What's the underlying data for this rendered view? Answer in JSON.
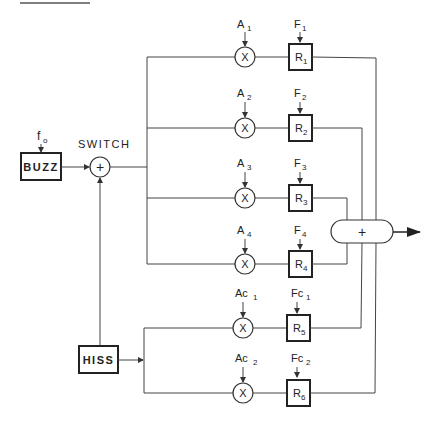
{
  "diagram": {
    "title": "",
    "colors": {
      "line": "#444444",
      "box": "#222222",
      "text": "#222222",
      "background": "#ffffff"
    },
    "sources": [
      {
        "id": "buzz",
        "label": "BUZZ",
        "input_label": "f",
        "input_sub": "o"
      },
      {
        "id": "hiss",
        "label": "HISS"
      }
    ],
    "switch": {
      "label": "SWITCH",
      "symbol": "+"
    },
    "branches": [
      {
        "amp": "A",
        "amp_sub": "1",
        "freq": "F",
        "freq_sub": "1",
        "mult": "X",
        "res": "R",
        "res_sub": "1"
      },
      {
        "amp": "A",
        "amp_sub": "2",
        "freq": "F",
        "freq_sub": "2",
        "mult": "X",
        "res": "R",
        "res_sub": "2"
      },
      {
        "amp": "A",
        "amp_sub": "3",
        "freq": "F",
        "freq_sub": "3",
        "mult": "X",
        "res": "R",
        "res_sub": "3"
      },
      {
        "amp": "A",
        "amp_sub": "4",
        "freq": "F",
        "freq_sub": "4",
        "mult": "X",
        "res": "R",
        "res_sub": "4"
      },
      {
        "amp": "Ac",
        "amp_sub": "1",
        "freq": "Fc",
        "freq_sub": "1",
        "mult": "X",
        "res": "R",
        "res_sub": "5"
      },
      {
        "amp": "Ac",
        "amp_sub": "2",
        "freq": "Fc",
        "freq_sub": "2",
        "mult": "X",
        "res": "R",
        "res_sub": "6"
      }
    ],
    "summer": {
      "symbol": "+"
    }
  }
}
